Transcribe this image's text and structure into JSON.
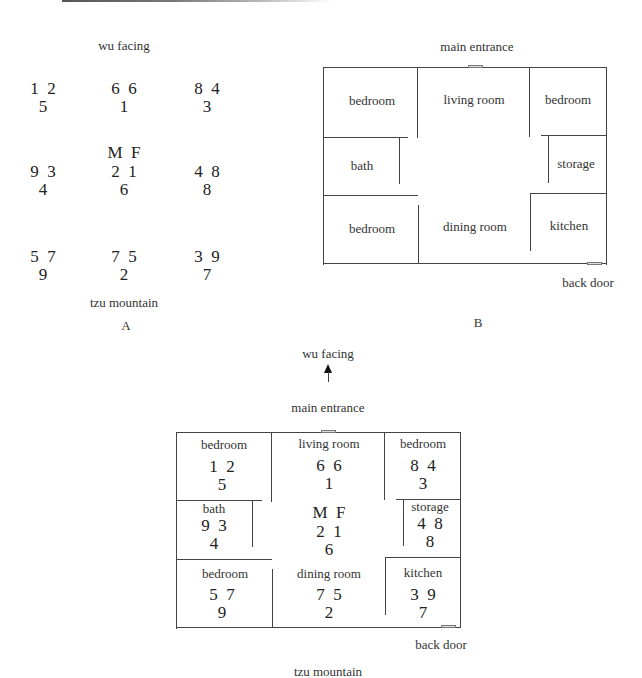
{
  "header": {
    "rule": "top-gradient-rule"
  },
  "figure_a": {
    "top_label": "wu facing",
    "bottom_label": "tzu mountain",
    "caption": "A",
    "center_header": "M  F",
    "grid": [
      {
        "top": "1  2",
        "bottom": "5"
      },
      {
        "top": "6  6",
        "bottom": "1"
      },
      {
        "top": "8  4",
        "bottom": "3"
      },
      {
        "top": "9  3",
        "bottom": "4"
      },
      {
        "top": "2  1",
        "bottom": "6"
      },
      {
        "top": "4  8",
        "bottom": "8"
      },
      {
        "top": "5  7",
        "bottom": "9"
      },
      {
        "top": "7  5",
        "bottom": "2"
      },
      {
        "top": "3  9",
        "bottom": "7"
      }
    ]
  },
  "figure_b": {
    "top_label": "main entrance",
    "back_label": "back door",
    "caption": "B",
    "rooms": [
      "bedroom",
      "living room",
      "bedroom",
      "bath",
      "storage",
      "bedroom",
      "dining room",
      "kitchen"
    ]
  },
  "figure_c": {
    "direction_label": "wu facing",
    "direction_icon": "arrow-up-icon",
    "top_label": "main entrance",
    "back_label": "back door",
    "bottom_label": "tzu mountain",
    "center_header": "M  F",
    "rooms": [
      {
        "name": "bedroom",
        "top": "1  2",
        "bottom": "5"
      },
      {
        "name": "living room",
        "top": "6  6",
        "bottom": "1"
      },
      {
        "name": "bedroom",
        "top": "8  4",
        "bottom": "3"
      },
      {
        "name": "bath",
        "top": "9  3",
        "bottom": "4"
      },
      {
        "name": "",
        "top": "2  1",
        "bottom": "6"
      },
      {
        "name": "storage",
        "top": "4  8",
        "bottom": "8"
      },
      {
        "name": "bedroom",
        "top": "5  7",
        "bottom": "9"
      },
      {
        "name": "dining room",
        "top": "7  5",
        "bottom": "2"
      },
      {
        "name": "kitchen",
        "top": "3  9",
        "bottom": "7"
      }
    ]
  }
}
